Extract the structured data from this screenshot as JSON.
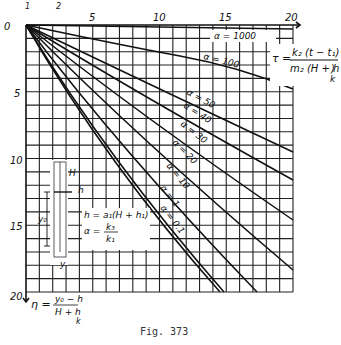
{
  "chart_data": {
    "type": "line",
    "title": "",
    "caption": "Fig. 373",
    "xlabel": "τ = k2(t − t1) / (m2(H + hk))",
    "ylabel": "η = (y0 − h) / (H + hk)",
    "xlim": [
      0,
      20
    ],
    "ylim": [
      0,
      20
    ],
    "y_inverted": true,
    "x_ticks": [
      0,
      5,
      10,
      15,
      20
    ],
    "y_ticks": [
      0,
      5,
      10,
      15,
      20
    ],
    "grid": true,
    "legend_position": "inline labels on curves",
    "series": [
      {
        "name": "α = 1000",
        "x": [
          0,
          20
        ],
        "y": [
          0,
          0.3
        ]
      },
      {
        "name": "α = 100",
        "x": [
          0,
          5,
          10,
          15,
          20
        ],
        "y": [
          0,
          1.0,
          2.0,
          3.3,
          4.8
        ]
      },
      {
        "name": "α = 50",
        "x": [
          0,
          5,
          10,
          15,
          20
        ],
        "y": [
          0,
          2.2,
          4.5,
          7.0,
          9.5
        ]
      },
      {
        "name": "α = 40",
        "x": [
          0,
          5,
          10,
          15,
          20
        ],
        "y": [
          0,
          2.8,
          5.7,
          8.6,
          11.6
        ]
      },
      {
        "name": "α = 30",
        "x": [
          0,
          5,
          10,
          15,
          20
        ],
        "y": [
          0,
          3.6,
          7.2,
          10.9,
          14.6
        ]
      },
      {
        "name": "α = 20",
        "x": [
          0,
          5,
          10,
          15,
          20
        ],
        "y": [
          0,
          4.5,
          9.0,
          13.6,
          18.3
        ]
      },
      {
        "name": "α = 10",
        "x": [
          0,
          5,
          10,
          15,
          17.3
        ],
        "y": [
          0,
          5.4,
          10.9,
          16.4,
          20.0
        ]
      },
      {
        "name": "α = 1",
        "x": [
          0,
          5,
          10,
          14.8
        ],
        "y": [
          0,
          6.6,
          13.4,
          20.0
        ]
      },
      {
        "name": "α = 0.1",
        "x": [
          0,
          5,
          10,
          14.5
        ],
        "y": [
          0,
          6.9,
          13.8,
          20.0
        ]
      }
    ],
    "annotations": [
      "h = a1(H + h1)",
      "α = k3 / k1",
      "H",
      "h",
      "y0",
      "y"
    ]
  },
  "labels": {
    "x_ticks": [
      "0",
      "5",
      "10",
      "15",
      "20"
    ],
    "y_ticks": [
      "5",
      "10",
      "15",
      "20"
    ],
    "top_axis_extra": [
      "1",
      "2"
    ],
    "tau_formula": {
      "lhs": "τ =",
      "num": "k₂ (t − t₁)",
      "den": "m₂ (H + h",
      "den_sub": "k",
      "den_close": ")"
    },
    "eta_formula": {
      "lhs": "η =",
      "num": "y₀ − h",
      "den": "H + h",
      "den_sub": "k"
    },
    "h_formula": "h = a₁(H + h₁)",
    "alpha_formula": {
      "lhs": "α =",
      "num": "k₃",
      "den": "k₁"
    },
    "curves": [
      "α = 1000",
      "α = 100",
      "α = 50",
      "α = 40",
      "α = 30",
      "α = 20",
      "α = 10",
      "α = 1",
      "α = 0.1"
    ],
    "sketch": {
      "H": "H",
      "h": "h",
      "y0": "y₀",
      "y": "y"
    },
    "caption": "Fig. 373"
  }
}
